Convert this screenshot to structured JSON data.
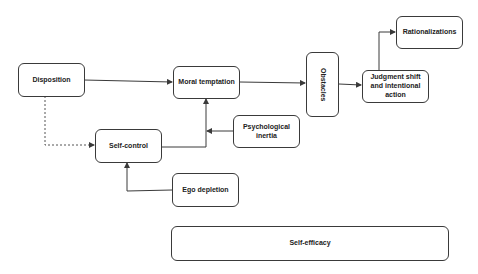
{
  "diagram": {
    "nodes": [
      {
        "id": "disposition",
        "label": "Disposition"
      },
      {
        "id": "moral-temptation",
        "label": "Moral temptation"
      },
      {
        "id": "obstacles",
        "label": "Obstacles"
      },
      {
        "id": "judgment-shift",
        "label": "Judgment shift and intentional action"
      },
      {
        "id": "rationalizations",
        "label": "Rationalizations"
      },
      {
        "id": "self-control",
        "label": "Self-control"
      },
      {
        "id": "psychological-inertia",
        "label": "Psychological inertia"
      },
      {
        "id": "ego-depletion",
        "label": "Ego depletion"
      },
      {
        "id": "self-efficacy",
        "label": "Self-efficacy"
      }
    ],
    "edges": [
      {
        "from": "disposition",
        "to": "moral-temptation",
        "style": "solid"
      },
      {
        "from": "disposition",
        "to": "self-control",
        "style": "dashed"
      },
      {
        "from": "self-control",
        "to": "moral-temptation",
        "style": "solid"
      },
      {
        "from": "psychological-inertia",
        "to": "moral-temptation",
        "style": "solid"
      },
      {
        "from": "ego-depletion",
        "to": "self-control",
        "style": "solid"
      },
      {
        "from": "moral-temptation",
        "to": "obstacles",
        "style": "solid"
      },
      {
        "from": "obstacles",
        "to": "judgment-shift",
        "style": "solid"
      },
      {
        "from": "judgment-shift",
        "to": "rationalizations",
        "style": "solid"
      }
    ],
    "colors": {
      "stroke": "#3a3a3a",
      "text": "#222222",
      "background": "#ffffff"
    }
  }
}
